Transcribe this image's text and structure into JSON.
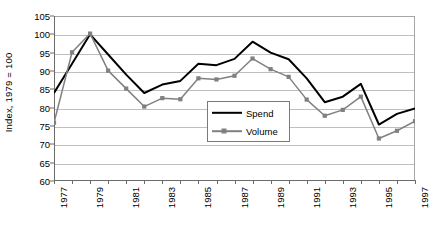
{
  "chart_data": {
    "type": "line",
    "title": "",
    "xlabel": "",
    "ylabel": "Index, 1979 = 100",
    "ylim": [
      60,
      105
    ],
    "xlim": [
      1977,
      1997
    ],
    "yticks": [
      60,
      65,
      70,
      75,
      80,
      85,
      90,
      95,
      100,
      105
    ],
    "grid": true,
    "legend_position": "center",
    "x": [
      1977,
      1978,
      1979,
      1980,
      1981,
      1982,
      1983,
      1984,
      1985,
      1986,
      1987,
      1988,
      1989,
      1990,
      1991,
      1992,
      1993,
      1994,
      1995,
      1996,
      1997
    ],
    "xtick_labels": [
      "1977",
      "1979",
      "1981",
      "1983",
      "1985",
      "1987",
      "1989",
      "1991",
      "1993",
      "1995",
      "1997"
    ],
    "xtick_values": [
      1977,
      1979,
      1981,
      1983,
      1985,
      1987,
      1989,
      1991,
      1993,
      1995,
      1997
    ],
    "series": [
      {
        "name": "Spend",
        "color": "#000000",
        "marker": "none",
        "values": [
          84.0,
          92.0,
          100.0,
          94.5,
          89.0,
          84.0,
          86.3,
          87.3,
          92.0,
          91.6,
          93.3,
          98.0,
          95.0,
          93.2,
          88.0,
          81.5,
          83.0,
          86.5,
          75.4,
          78.3,
          79.8
        ]
      },
      {
        "name": "Volume",
        "color": "#808080",
        "marker": "square",
        "values": [
          75.9,
          95.1,
          100.2,
          90.1,
          85.2,
          80.3,
          82.6,
          82.3,
          88.0,
          87.7,
          88.7,
          93.4,
          90.5,
          88.4,
          82.2,
          77.8,
          79.4,
          83.0,
          71.6,
          73.7,
          76.3
        ]
      }
    ]
  },
  "legend": {
    "items": [
      {
        "label": "Spend"
      },
      {
        "label": "Volume"
      }
    ]
  }
}
